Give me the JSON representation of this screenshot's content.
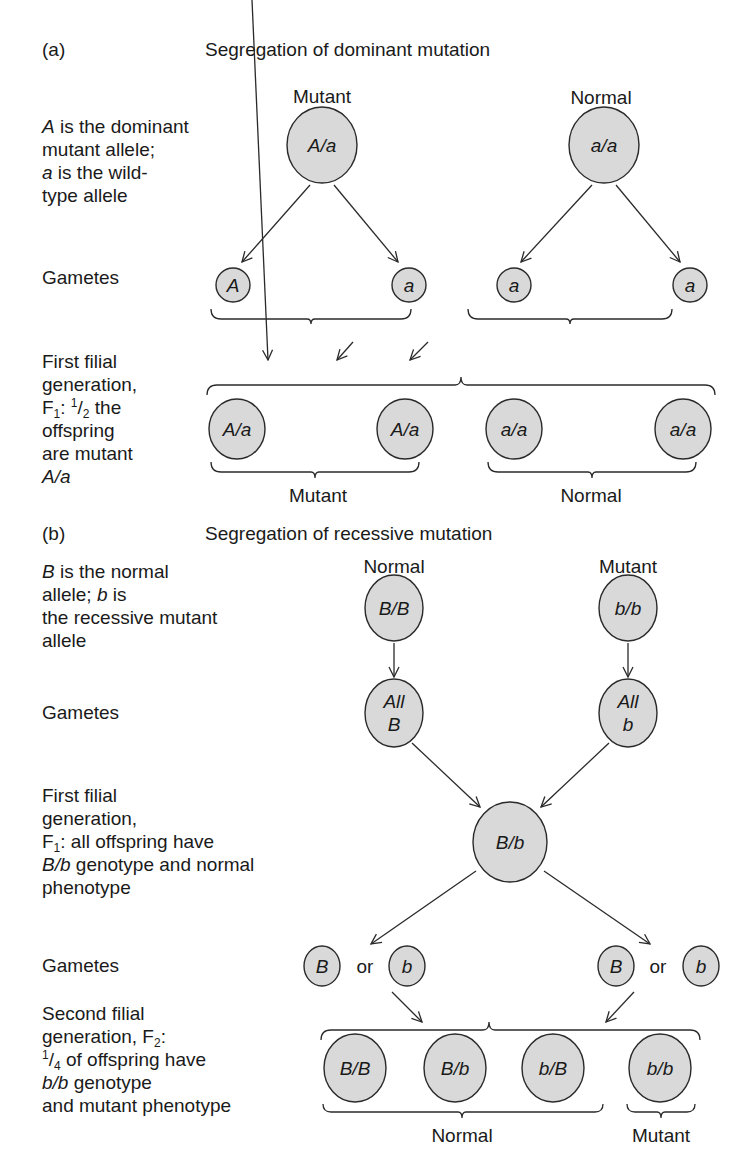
{
  "colors": {
    "node_fill": "#d9d9d9",
    "stroke": "#2a2a2a",
    "text": "#1a1a1a",
    "background": "#ffffff"
  },
  "panel_a": {
    "label": "(a)",
    "title": "Segregation of dominant mutation",
    "row_labels": [
      {
        "id": "alleles",
        "lines": [
          [
            {
              "t": "A",
              "i": true
            },
            {
              "t": " is the dominant"
            }
          ],
          [
            {
              "t": "mutant allele;"
            }
          ],
          [
            {
              "t": "a",
              "i": true
            },
            {
              "t": " is the wild-"
            }
          ],
          [
            {
              "t": "type allele"
            }
          ]
        ]
      },
      {
        "id": "gametes",
        "lines": [
          [
            {
              "t": "Gametes"
            }
          ]
        ]
      },
      {
        "id": "f1",
        "lines": [
          [
            {
              "t": "First filial"
            }
          ],
          [
            {
              "t": "generation,"
            }
          ],
          [
            {
              "t": "F"
            },
            {
              "t": "1",
              "sub": true
            },
            {
              "t": ": "
            },
            {
              "t": "1",
              "sup": true
            },
            {
              "t": "/"
            },
            {
              "t": "2",
              "sub": true
            },
            {
              "t": " the"
            }
          ],
          [
            {
              "t": "offspring"
            }
          ],
          [
            {
              "t": "are mutant"
            }
          ],
          [
            {
              "t": "A/a",
              "i": true
            }
          ]
        ]
      }
    ],
    "parents": [
      {
        "phenotype": "Mutant",
        "genotype": "A/a"
      },
      {
        "phenotype": "Normal",
        "genotype": "a/a"
      }
    ],
    "gametes": [
      "A",
      "a",
      "a",
      "a"
    ],
    "offspring": [
      "A/a",
      "A/a",
      "a/a",
      "a/a"
    ],
    "offspring_groups": [
      "Mutant",
      "Normal"
    ]
  },
  "panel_b": {
    "label": "(b)",
    "title": "Segregation of recessive mutation",
    "row_labels": [
      {
        "id": "alleles",
        "lines": [
          [
            {
              "t": "B",
              "i": true
            },
            {
              "t": " is the normal"
            }
          ],
          [
            {
              "t": "allele; "
            },
            {
              "t": "b",
              "i": true
            },
            {
              "t": " is"
            }
          ],
          [
            {
              "t": "the recessive mutant"
            }
          ],
          [
            {
              "t": "allele"
            }
          ]
        ]
      },
      {
        "id": "gametes",
        "lines": [
          [
            {
              "t": "Gametes"
            }
          ]
        ]
      },
      {
        "id": "f1",
        "lines": [
          [
            {
              "t": "First filial"
            }
          ],
          [
            {
              "t": "generation,"
            }
          ],
          [
            {
              "t": "F"
            },
            {
              "t": "1",
              "sub": true
            },
            {
              "t": ": all offspring have"
            }
          ],
          [
            {
              "t": "B/b",
              "i": true
            },
            {
              "t": " genotype and normal"
            }
          ],
          [
            {
              "t": "phenotype"
            }
          ]
        ]
      },
      {
        "id": "gametes2",
        "lines": [
          [
            {
              "t": "Gametes"
            }
          ]
        ]
      },
      {
        "id": "f2",
        "lines": [
          [
            {
              "t": "Second filial"
            }
          ],
          [
            {
              "t": "generation, F"
            },
            {
              "t": "2",
              "sub": true
            },
            {
              "t": ":"
            }
          ],
          [
            {
              "t": "1",
              "sup": true
            },
            {
              "t": "/"
            },
            {
              "t": "4",
              "sub": true
            },
            {
              "t": " of offspring have"
            }
          ],
          [
            {
              "t": "b/b",
              "i": true
            },
            {
              "t": " genotype"
            }
          ],
          [
            {
              "t": "and mutant phenotype"
            }
          ]
        ]
      }
    ],
    "parents": [
      {
        "phenotype": "Normal",
        "genotype": "B/B"
      },
      {
        "phenotype": "Mutant",
        "genotype": "b/b"
      }
    ],
    "parent_gametes": [
      [
        "All",
        "B"
      ],
      [
        "All",
        "b"
      ]
    ],
    "f1_genotype": "B/b",
    "f1_gametes": [
      "B",
      "b",
      "B",
      "b"
    ],
    "or_label": "or",
    "f2_offspring": [
      "B/B",
      "B/b",
      "b/B",
      "b/b"
    ],
    "f2_groups": [
      "Normal",
      "Mutant"
    ]
  }
}
